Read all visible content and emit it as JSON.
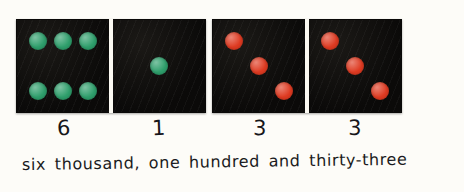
{
  "scene": {
    "kind": "handwritten-maths-worksheet",
    "background_color": "#fdfcf8",
    "ink_color": "#1a1a20"
  },
  "dominoes": [
    {
      "name": "domino-thousands-hundreds",
      "pip_color": "#2e9e6b",
      "pip_color_name": "green",
      "tile_color": "#0d0c0b",
      "halves": [
        {
          "name": "half-six",
          "value": 6,
          "pattern": "six-two-columns-of-three"
        },
        {
          "name": "half-one",
          "value": 1,
          "pattern": "one-centre"
        }
      ]
    },
    {
      "name": "domino-tens-units",
      "pip_color": "#de3a21",
      "pip_color_name": "red",
      "tile_color": "#0d0c0b",
      "halves": [
        {
          "name": "half-three-tens",
          "value": 3,
          "pattern": "three-diagonal"
        },
        {
          "name": "half-three-units",
          "value": 3,
          "pattern": "three-diagonal"
        }
      ]
    }
  ],
  "digits": [
    {
      "name": "digit-thousands",
      "label": "6"
    },
    {
      "name": "digit-hundreds",
      "label": "1"
    },
    {
      "name": "digit-tens",
      "label": "3"
    },
    {
      "name": "digit-units",
      "label": "3"
    }
  ],
  "sentence": {
    "text": "six thousand, one hundred and thirty-three"
  }
}
